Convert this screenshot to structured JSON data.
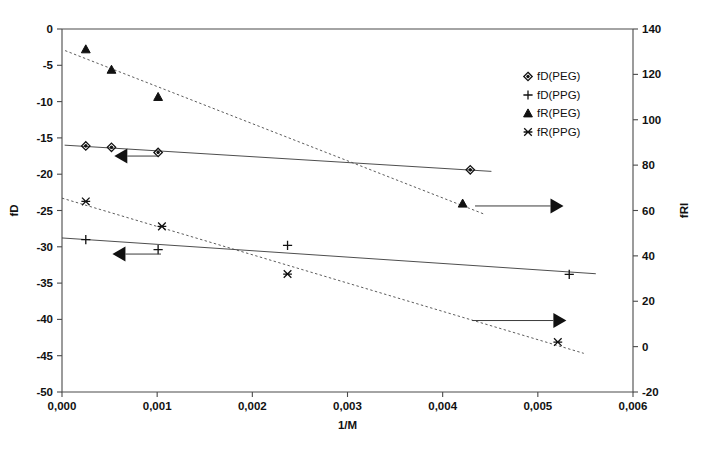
{
  "chart_data": {
    "type": "scatter",
    "title": "",
    "xlabel": "1/M",
    "ylabel": "fD",
    "y2label": "fRI",
    "xlim": [
      0.0,
      0.006
    ],
    "ylim": [
      -50,
      0
    ],
    "y2lim": [
      -20,
      140
    ],
    "grid": false,
    "legend_position": "top-right",
    "xticks": [
      "0,000",
      "0,001",
      "0,002",
      "0,003",
      "0,004",
      "0,005",
      "0,006"
    ],
    "xtick_values": [
      0.0,
      0.001,
      0.002,
      0.003,
      0.004,
      0.005,
      0.006
    ],
    "yticks": [
      "0",
      "-5",
      "-10",
      "-15",
      "-20",
      "-25",
      "-30",
      "-35",
      "-40",
      "-45",
      "-50"
    ],
    "ytick_values": [
      0,
      -5,
      -10,
      -15,
      -20,
      -25,
      -30,
      -35,
      -40,
      -45,
      -50
    ],
    "y2ticks": [
      "140",
      "120",
      "100",
      "80",
      "60",
      "40",
      "20",
      "0",
      "-20"
    ],
    "y2tick_values": [
      140,
      120,
      100,
      80,
      60,
      40,
      20,
      0,
      -20
    ],
    "series": [
      {
        "name": "fD(PEG)",
        "marker": "diamond",
        "axis": "left",
        "linestyle": "solid",
        "x": [
          0.00025,
          0.00052,
          0.00101,
          0.00429
        ],
        "y": [
          -16.1,
          -16.3,
          -17.0,
          -19.4
        ]
      },
      {
        "name": "fD(PPG)",
        "marker": "plus",
        "axis": "left",
        "linestyle": "solid",
        "x": [
          0.00025,
          0.00101,
          0.00237,
          0.00533
        ],
        "y": [
          -29.0,
          -30.4,
          -29.8,
          -33.8
        ]
      },
      {
        "name": "fR(PEG)",
        "marker": "triangle",
        "axis": "right",
        "linestyle": "dotted",
        "x": [
          0.00025,
          0.00052,
          0.00101,
          0.00421
        ],
        "y": [
          131,
          122,
          110,
          63
        ]
      },
      {
        "name": "fR(PPG)",
        "marker": "asterisk",
        "axis": "right",
        "linestyle": "dotted",
        "x": [
          0.00025,
          0.00105,
          0.00237,
          0.00521
        ],
        "y": [
          64,
          53,
          32,
          2
        ]
      }
    ],
    "annotations": [
      {
        "name": "left-arrow-upper",
        "direction": "left",
        "x_from": 0.00101,
        "x_to": 0.00055,
        "y_axis": "left",
        "y": -17.5
      },
      {
        "name": "left-arrow-lower",
        "direction": "left",
        "x_from": 0.00104,
        "x_to": 0.00053,
        "y_axis": "left",
        "y": -31.0
      },
      {
        "name": "right-arrow-upper",
        "direction": "right",
        "x_from": 0.00434,
        "x_to": 0.00527,
        "y_axis": "right",
        "y": 62.0
      },
      {
        "name": "right-arrow-lower",
        "direction": "right",
        "x_from": 0.00431,
        "x_to": 0.0053,
        "y_axis": "right",
        "y": 11.5
      }
    ]
  },
  "legend": {
    "entries": [
      {
        "label": "fD(PEG)",
        "marker": "diamond"
      },
      {
        "label": "fD(PPG)",
        "marker": "plus"
      },
      {
        "label": "fR(PEG)",
        "marker": "triangle"
      },
      {
        "label": "fR(PPG)",
        "marker": "asterisk"
      }
    ]
  },
  "colors": {
    "axis": "#4a4a4a",
    "marker": "#111111",
    "series_line": "#3a3a3a",
    "background": "#ffffff"
  }
}
